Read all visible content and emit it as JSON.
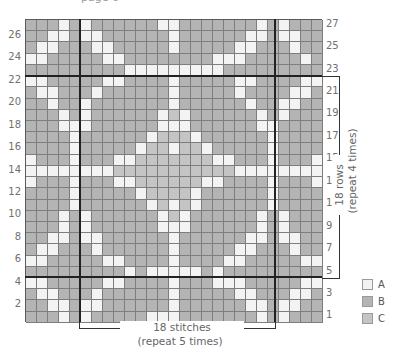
{
  "header": {
    "clipped_text": "page 6"
  },
  "legend": {
    "items": [
      {
        "key": "A",
        "label": "A",
        "color": "#f3f3f3"
      },
      {
        "key": "B",
        "label": "B",
        "color": "#b4b4b4"
      },
      {
        "key": "C",
        "label": "C",
        "color": "#c4c4c4"
      }
    ]
  },
  "chart": {
    "columns": 27,
    "rows": 27,
    "left_row_labels": [
      "26",
      "24",
      "22",
      "20",
      "18",
      "16",
      "14",
      "12",
      "10",
      "8",
      "6",
      "4",
      "2"
    ],
    "right_row_labels": [
      "27",
      "25",
      "23",
      "21",
      "19",
      "17",
      "15",
      "13",
      "11",
      "9",
      "7",
      "5",
      "3",
      "1"
    ],
    "stitch_repeat": {
      "label": "18 stitches",
      "sub": "(repeat 5 times)"
    },
    "row_repeat": {
      "label": "18 rows",
      "sub": "(repeat 4 times)"
    },
    "grid_top_to_bottom": [
      "BBBABABBBBBBAABBBBBBBABABBB",
      "BBAABAABBBBBBABBBBBBAABAABB",
      "BAABBBAABBBBBABBBBBAABBBABB",
      "AABBBBBAABBBBBBBBAAABBBBBAB",
      "BBBBBBBBBAAAAAAAAABBBBBBBBB",
      "AABBBBBAABBBBABBBBBAABBBBAA",
      "BAABBBABBBBBBABBBBBABBBBAAB",
      "BBABBABBBBBBBABBBBBBABBAABB",
      "BBBABABBBBBBACABBBBBBABABBB",
      "BBBAAABBBBBBAAABBBBBBAABBBB",
      "BBBBABBBBBBACCCABBBBBBABBBB",
      "BBBBABBBBBACCACCABBBBBABBBB",
      "ABBBABBBAACCCCCCCAABBBABBBA",
      "AAAAAAAACCCCCCCCCCCAAAAAAAA",
      "ABBBABBBAACCCCCCAABBBBABBBA",
      "BBBBABBBBBACCCCABBBBBBABBBB",
      "BBBBABBBBBBACACABBBBBBABBBB",
      "BBBABABBBBBBACABBBBBBABABBB",
      "BBBABABBBBBBAAABBBBBBABABBB",
      "BBAABAABBBBBBABBBBBBAABAABB",
      "BAABBBABBBBBBABBBBBAABBBABB",
      "AABBBBBAABBBBABBBBAABBBBBAA",
      "BBBBBBBBBABAAAAABABBBBBBBBB",
      "AABBBBBAABBBBABBBAAABBBBBAA",
      "BAABBBABBBBBBABBBBBAABBBAAB",
      "BBAABAABBBBBBABBBBBBAABAABB",
      "BBBABABBBBBAAABBBBBBBABABBB"
    ]
  }
}
